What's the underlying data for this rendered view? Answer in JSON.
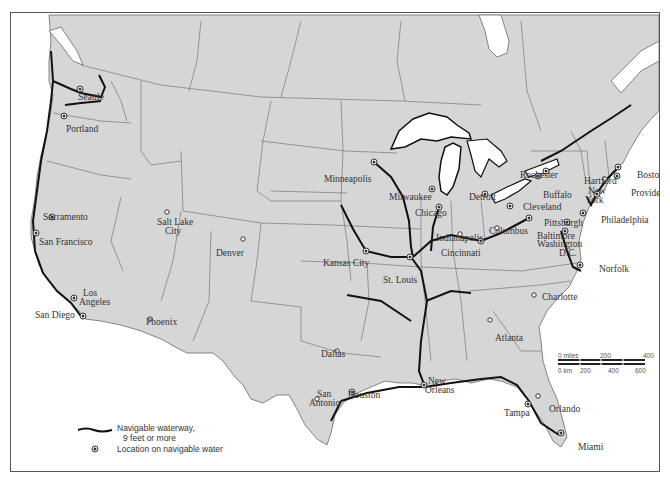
{
  "map": {
    "title": "",
    "colors": {
      "land": "#d6d6d6",
      "water": "#ffffff",
      "border": "#6a6a6a",
      "waterway": "#111111"
    },
    "cities": [
      {
        "name": "Seattle",
        "type": "navigable",
        "x": 79,
        "y": 88
      },
      {
        "name": "Portland",
        "type": "navigable",
        "x": 63,
        "y": 115
      },
      {
        "name": "Sacramento",
        "type": "navigable",
        "x": 51,
        "y": 216
      },
      {
        "name": "San Francisco",
        "type": "navigable",
        "x": 35,
        "y": 232
      },
      {
        "name": "Los Angeles",
        "type": "navigable",
        "x": 73,
        "y": 297
      },
      {
        "name": "San Diego",
        "type": "navigable",
        "x": 82,
        "y": 315
      },
      {
        "name": "Salt Lake City",
        "type": "other",
        "x": 166,
        "y": 211
      },
      {
        "name": "Phoenix",
        "type": "other",
        "x": 149,
        "y": 318
      },
      {
        "name": "Denver",
        "type": "other",
        "x": 242,
        "y": 238
      },
      {
        "name": "Minneapolis",
        "type": "navigable",
        "x": 373,
        "y": 161
      },
      {
        "name": "Milwaukee",
        "type": "navigable",
        "x": 431,
        "y": 188
      },
      {
        "name": "Chicago",
        "type": "navigable",
        "x": 438,
        "y": 206
      },
      {
        "name": "Detroit",
        "type": "navigable",
        "x": 484,
        "y": 193
      },
      {
        "name": "Rochester",
        "type": "navigable",
        "x": 545,
        "y": 170
      },
      {
        "name": "Buffalo",
        "type": "navigable",
        "x": 537,
        "y": 175
      },
      {
        "name": "Cleveland",
        "type": "navigable",
        "x": 509,
        "y": 205
      },
      {
        "name": "Columbus",
        "type": "other",
        "x": 496,
        "y": 227
      },
      {
        "name": "Indianapolis",
        "type": "other",
        "x": 459,
        "y": 233
      },
      {
        "name": "Cincinnati",
        "type": "navigable",
        "x": 480,
        "y": 240
      },
      {
        "name": "Pittsburgh",
        "type": "navigable",
        "x": 528,
        "y": 217
      },
      {
        "name": "Baltimore",
        "type": "navigable",
        "x": 566,
        "y": 221
      },
      {
        "name": "Washington D.C.",
        "type": "navigable",
        "x": 564,
        "y": 230
      },
      {
        "name": "Hartford",
        "type": "other",
        "x": 604,
        "y": 178
      },
      {
        "name": "New York",
        "type": "navigable",
        "x": 596,
        "y": 193
      },
      {
        "name": "Boston",
        "type": "navigable",
        "x": 617,
        "y": 166
      },
      {
        "name": "Providence",
        "type": "navigable",
        "x": 616,
        "y": 175
      },
      {
        "name": "Philadelphia",
        "type": "navigable",
        "x": 582,
        "y": 212
      },
      {
        "name": "Norfolk",
        "type": "navigable",
        "x": 579,
        "y": 264
      },
      {
        "name": "Kansas City",
        "type": "navigable",
        "x": 365,
        "y": 250
      },
      {
        "name": "St. Louis",
        "type": "navigable",
        "x": 409,
        "y": 256
      },
      {
        "name": "Charlotte",
        "type": "other",
        "x": 533,
        "y": 294
      },
      {
        "name": "Atlanta",
        "type": "other",
        "x": 489,
        "y": 319
      },
      {
        "name": "Dallas",
        "type": "other",
        "x": 336,
        "y": 350
      },
      {
        "name": "San Antonio",
        "type": "other",
        "x": 316,
        "y": 398
      },
      {
        "name": "Houston",
        "type": "navigable",
        "x": 351,
        "y": 391
      },
      {
        "name": "New Orleans",
        "type": "navigable",
        "x": 423,
        "y": 384
      },
      {
        "name": "Tampa",
        "type": "navigable",
        "x": 527,
        "y": 403
      },
      {
        "name": "Orlando",
        "type": "other",
        "x": 537,
        "y": 395
      },
      {
        "name": "Miami",
        "type": "navigable",
        "x": 560,
        "y": 432
      }
    ],
    "labels": {
      "seattle": "Seattle",
      "portland": "Portland",
      "sacramento": "Sacramento",
      "san_francisco": "San Francisco",
      "los_angeles_1": "Los",
      "los_angeles_2": "Angeles",
      "san_diego": "San Diego",
      "salt_lake_1": "Salt Lake",
      "salt_lake_2": "City",
      "phoenix": "Phoenix",
      "denver": "Denver",
      "minneapolis": "Minneapolis",
      "milwaukee": "Milwaukee",
      "chicago": "Chicago",
      "detroit": "Detroit",
      "rochester": "Rochester",
      "buffalo": "Buffalo",
      "cleveland": "Cleveland",
      "columbus": "Columbus",
      "indianapolis": "Indianapolis",
      "cincinnati": "Cincinnati",
      "pittsburgh": "Pittsburgh",
      "baltimore": "Baltimore",
      "washington_1": "Washington",
      "washington_2": "D.C.",
      "hartford": "Hartford",
      "new_york_1": "New",
      "new_york_2": "York",
      "boston": "Boston",
      "providence": "Providence",
      "philadelphia": "Philadelphia",
      "norfolk": "Norfolk",
      "kansas_city": "Kansas City",
      "st_louis": "St. Louis",
      "charlotte": "Charlotte",
      "atlanta": "Atlanta",
      "dallas": "Dallas",
      "san_antonio_1": "San",
      "san_antonio_2": "Antonio",
      "houston": "Houston",
      "new_orleans_1": "New",
      "new_orleans_2": "Orleans",
      "tampa": "Tampa",
      "orlando": "Orlando",
      "miami": "Miami"
    }
  },
  "legend": {
    "waterway_line1": "Navigable waterway,",
    "waterway_line2": "9 feet or more",
    "location": "Location on navigable water"
  },
  "scale_bar": {
    "miles_label": "0 miles",
    "miles_mid": "200",
    "miles_max": "400",
    "km_label": "0 km",
    "km_1": "200",
    "km_2": "400",
    "km_3": "600"
  }
}
